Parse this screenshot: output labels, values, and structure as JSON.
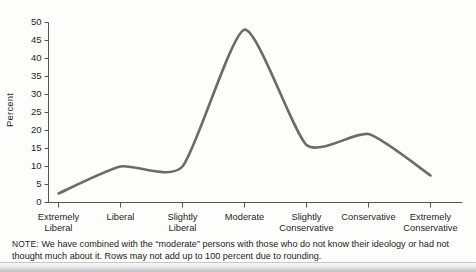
{
  "chart_data": {
    "type": "line",
    "title": "",
    "xlabel": "",
    "ylabel": "Percent",
    "categories": [
      "Extremely\nLiberal",
      "Liberal",
      "Slightly\nLiberal",
      "Moderate",
      "Slightly\nConservative",
      "Conservative",
      "Extremely\nConservative"
    ],
    "values": [
      2.5,
      10,
      10,
      48,
      16,
      19,
      7.5
    ],
    "ylim": [
      0,
      50
    ],
    "yticks": [
      0,
      5,
      10,
      15,
      20,
      25,
      30,
      35,
      40,
      45,
      50
    ],
    "ytick_labels": [
      "0",
      "5",
      "10",
      "15",
      "20",
      "25",
      "30",
      "35",
      "40",
      "45",
      "50"
    ],
    "grid": false,
    "legend": null,
    "line_color": "#6b6b6b",
    "axis_color": "#555555",
    "smoothing": "spline"
  },
  "note": {
    "tag": "NOTE:",
    "line1": "We have combined with the “moderate” persons with those who do not know their ideology or had not",
    "line2": "thought much about it. Rows may not add up to 100 percent due to rounding."
  }
}
